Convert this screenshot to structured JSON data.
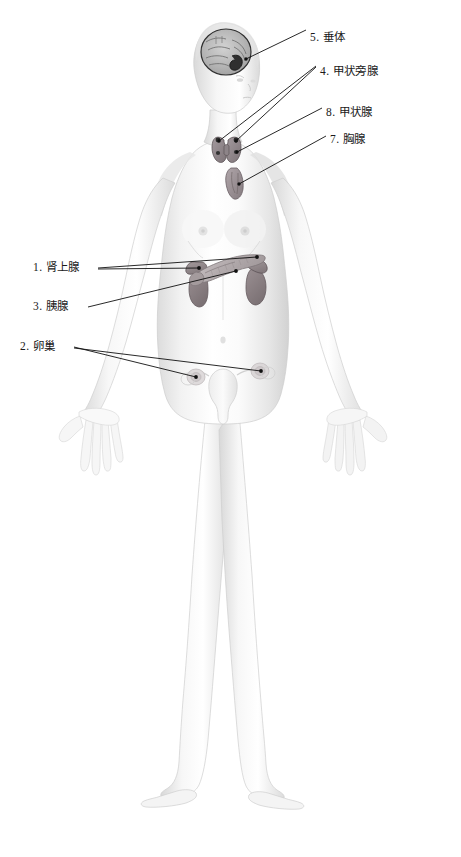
{
  "page": {
    "background_color": "#ffffff",
    "width": 461,
    "height": 857,
    "text_color": "#1a1a1a",
    "leader_color": "#111111"
  },
  "figure": {
    "name": "female-body-anterior",
    "skin_light": "#fdfdfd",
    "skin_mid": "#ededed",
    "skin_shadow": "#d6d6d6",
    "outline": "#c9c9c9"
  },
  "organs": [
    {
      "name": "pituitary-gland",
      "label_cn": "垂体",
      "number": "5",
      "fill": "#3a3a3a"
    },
    {
      "name": "brain",
      "label_cn": "脑",
      "number": "",
      "fill": "#b9b9b9"
    },
    {
      "name": "parathyroid-gland",
      "label_cn": "甲状旁腺",
      "number": "4",
      "fill": "#6e6668"
    },
    {
      "name": "thyroid-gland",
      "label_cn": "甲状腺",
      "number": "8",
      "fill": "#8a8084"
    },
    {
      "name": "thymus",
      "label_cn": "胸腺",
      "number": "7",
      "fill": "#9a9094"
    },
    {
      "name": "adrenal-gland",
      "label_cn": "肾上腺",
      "number": "1",
      "fill": "#8e8488"
    },
    {
      "name": "pancreas",
      "label_cn": "胰腺",
      "number": "3",
      "fill": "#b4acae"
    },
    {
      "name": "kidney",
      "label_cn": "肾",
      "number": "",
      "fill": "#8a7f82"
    },
    {
      "name": "ovary",
      "label_cn": "卵巢",
      "number": "2",
      "fill": "#c9c2c4"
    },
    {
      "name": "uterus",
      "label_cn": "子宫",
      "number": "",
      "fill": "#e6e2e3"
    }
  ],
  "labels": {
    "right": [
      {
        "id": "pituitary",
        "text": "5. 垂体",
        "x": 310,
        "y": 32,
        "dot_x": 246,
        "dot_y": 59
      },
      {
        "id": "parathyroid",
        "text": "4. 甲状旁腺",
        "x": 320,
        "y": 66,
        "dot_x": 230,
        "dot_y": 139,
        "dot2_x": 244,
        "dot2_y": 140
      },
      {
        "id": "thyroid",
        "text": "8. 甲状腺",
        "x": 326,
        "y": 107,
        "dot_x": 234,
        "dot_y": 150
      },
      {
        "id": "thymus",
        "text": "7. 胸腺",
        "x": 330,
        "y": 134,
        "dot_x": 239,
        "dot_y": 183
      }
    ],
    "left": [
      {
        "id": "adrenal",
        "text": "1. 肾上腺",
        "x": 33,
        "y": 263,
        "dot_x": 252,
        "dot_y": 256,
        "dot2_x": 212,
        "dot2_y": 272
      },
      {
        "id": "pancreas",
        "text": "3. 胰腺",
        "x": 33,
        "y": 303,
        "dot_x": 242,
        "dot_y": 272
      },
      {
        "id": "ovary",
        "text": "2. 卵巢",
        "x": 20,
        "y": 344,
        "dot_x": 202,
        "dot_y": 377,
        "dot2_x": 265,
        "dot2_y": 371
      }
    ]
  }
}
